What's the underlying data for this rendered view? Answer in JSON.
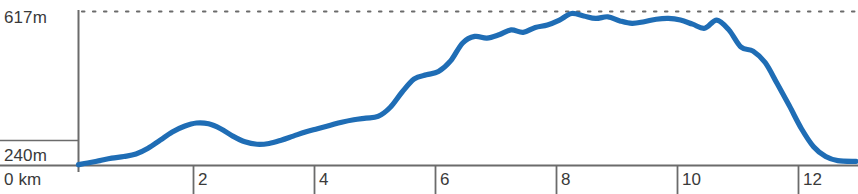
{
  "chart_data": {
    "type": "area",
    "title": "",
    "subtitle": "",
    "xlabel": "km",
    "ylabel": "m",
    "xunit": "km",
    "yunit": "m",
    "grid": false,
    "legend": null,
    "xlim": [
      0,
      12.85
    ],
    "ylim": [
      240,
      617
    ],
    "x_tick_labels": [
      "2",
      "4",
      "6",
      "8",
      "10",
      "12"
    ],
    "x_ticks": [
      2,
      4,
      6,
      8,
      10,
      12
    ],
    "y_tick_labels": [
      "617m",
      "240m"
    ],
    "y_ticks": [
      617,
      240
    ],
    "origin_label": "0 km",
    "max_label": "617m",
    "min_label": "240m",
    "reference_line": {
      "value": 617,
      "style": "dotted",
      "label": "617m"
    },
    "line_color": "#1f6db5",
    "axis_color": "#6b6b6b",
    "background": "#ffffff",
    "series": [
      {
        "name": "Elevation",
        "x": [
          0.0,
          0.15,
          0.35,
          0.55,
          0.75,
          0.95,
          1.15,
          1.35,
          1.55,
          1.75,
          1.95,
          2.15,
          2.35,
          2.55,
          2.75,
          2.95,
          3.15,
          3.35,
          3.55,
          3.75,
          3.95,
          4.15,
          4.35,
          4.55,
          4.75,
          4.95,
          5.15,
          5.35,
          5.55,
          5.75,
          5.95,
          6.15,
          6.35,
          6.55,
          6.75,
          6.95,
          7.15,
          7.35,
          7.55,
          7.75,
          7.95,
          8.15,
          8.35,
          8.55,
          8.75,
          8.95,
          9.15,
          9.35,
          9.55,
          9.75,
          9.95,
          10.15,
          10.35,
          10.55,
          10.75,
          10.95,
          11.15,
          11.35,
          11.55,
          11.75,
          11.95,
          12.15,
          12.35,
          12.55,
          12.85
        ],
        "values": [
          242,
          246,
          252,
          258,
          262,
          268,
          282,
          302,
          322,
          336,
          344,
          342,
          330,
          312,
          298,
          292,
          294,
          302,
          312,
          322,
          330,
          338,
          346,
          352,
          356,
          360,
          382,
          420,
          452,
          462,
          470,
          496,
          540,
          556,
          552,
          560,
          572,
          566,
          578,
          584,
          596,
          612,
          606,
          600,
          604,
          594,
          588,
          592,
          598,
          600,
          596,
          586,
          576,
          596,
          572,
          530,
          520,
          492,
          440,
          386,
          330,
          286,
          262,
          252,
          250
        ]
      }
    ],
    "annotations": []
  }
}
